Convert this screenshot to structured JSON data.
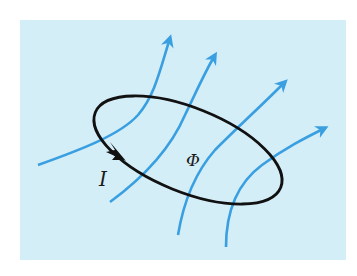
{
  "diagram": {
    "background_color": "#d4eef8",
    "field_line_color": "#3a9fe0",
    "loop_color": "#111111",
    "labels": {
      "current": "I",
      "flux": "Φ"
    },
    "elements": {
      "field_lines": 5,
      "current_loop": "ellipse",
      "current_direction": "arrow on loop (left side, pointing down-right)"
    }
  }
}
